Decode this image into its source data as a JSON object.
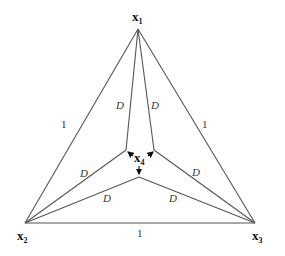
{
  "diagram": {
    "type": "triangle-with-interior-point-construction",
    "vertices": {
      "x1": {
        "label": "x",
        "sub": "1"
      },
      "x2": {
        "label": "x",
        "sub": "2"
      },
      "x3": {
        "label": "x",
        "sub": "3"
      },
      "x4": {
        "label": "x",
        "sub": "4"
      }
    },
    "outer_edge_labels": {
      "x1_x2": "1",
      "x1_x3": "1",
      "x2_x3": "1"
    },
    "inner_edge_labels": {
      "upper_left": "D",
      "upper_right": "D",
      "left": "D",
      "right": "D",
      "lower_left": "D",
      "lower_right": "D"
    }
  }
}
